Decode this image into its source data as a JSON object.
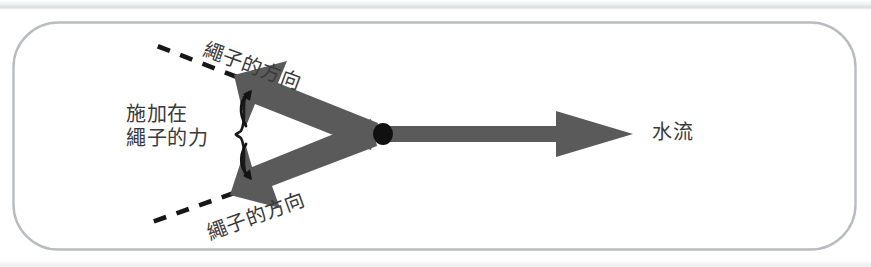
{
  "figure": {
    "background_color": "#ffffff",
    "border_color": "#b8bcc0",
    "arrow_color": "#5a5a5a",
    "dash_color": "#1a1a1a",
    "text_color": "#3a3a3a",
    "junction_color": "#101010"
  },
  "labels": {
    "rope_direction_top": "繩子的方向",
    "rope_direction_bottom": "繩子的方向",
    "applied_force_line1": "施加在",
    "applied_force_line2": "繩子的力",
    "water_flow": "水流"
  },
  "diagram_data": {
    "type": "vector-force-diagram",
    "junction_point": {
      "x": 383,
      "y": 134,
      "radius": 9
    },
    "vectors": [
      {
        "name": "rope-tension-upper",
        "label": "繩子的方向",
        "from": {
          "x": 383,
          "y": 134
        },
        "to": {
          "x": 234,
          "y": 75
        },
        "angle_deg": 158,
        "style": "solid-block-arrow"
      },
      {
        "name": "rope-tension-lower",
        "label": "繩子的方向",
        "from": {
          "x": 383,
          "y": 134
        },
        "to": {
          "x": 230,
          "y": 195
        },
        "angle_deg": 202,
        "style": "solid-block-arrow"
      },
      {
        "name": "water-flow",
        "label": "水流",
        "from": {
          "x": 390,
          "y": 134
        },
        "to": {
          "x": 633,
          "y": 134
        },
        "angle_deg": 0,
        "style": "solid-block-arrow"
      }
    ],
    "extension_lines": [
      {
        "name": "rope-extension-upper",
        "from": {
          "x": 234,
          "y": 76
        },
        "to": {
          "x": 152,
          "y": 44
        },
        "style": "dashed"
      },
      {
        "name": "rope-extension-lower",
        "from": {
          "x": 231,
          "y": 194
        },
        "to": {
          "x": 152,
          "y": 222
        },
        "style": "dashed"
      }
    ],
    "brace": {
      "name": "applied-force-brace",
      "x": 243,
      "top_y": 95,
      "bottom_y": 180,
      "points_to": [
        "rope-tension-upper",
        "rope-tension-lower"
      ]
    },
    "border_rect": {
      "x": 13,
      "y": 22,
      "width": 843,
      "height": 228,
      "radius": 45
    }
  }
}
